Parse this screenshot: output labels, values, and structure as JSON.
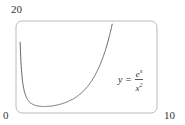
{
  "chart_data": {
    "type": "line",
    "title": "",
    "xlabel": "",
    "ylabel": "",
    "xlim": [
      0,
      10
    ],
    "ylim": [
      0,
      20
    ],
    "grid": false,
    "tick_labels": {
      "x_min": "0",
      "x_max": "10",
      "y_max": "20"
    },
    "series": [
      {
        "name": "y = e^x / x^2",
        "function": "e^x / x^2",
        "x": [
          0.3,
          0.4,
          0.5,
          0.75,
          1,
          1.5,
          2,
          2.5,
          3,
          3.5,
          4,
          4.5,
          5,
          5.5,
          6,
          6.5,
          6.85
        ],
        "y": [
          15.0,
          9.3,
          6.6,
          3.7,
          2.72,
          1.99,
          1.85,
          1.95,
          2.23,
          2.7,
          3.41,
          4.44,
          5.94,
          8.08,
          11.2,
          15.7,
          20.0
        ]
      }
    ],
    "annotations": [
      {
        "text_y": "y =",
        "numerator": "e",
        "numerator_exp": "x",
        "denominator": "x",
        "denominator_exp": "2",
        "position": "lower right of curve"
      }
    ],
    "frame": "rounded rectangle"
  },
  "labels": {
    "y_max": "20",
    "x_min": "0",
    "x_max": "10",
    "eq_lhs": "y =",
    "eq_num": "e",
    "eq_num_exp": "x",
    "eq_den": "x",
    "eq_den_exp": "2"
  }
}
